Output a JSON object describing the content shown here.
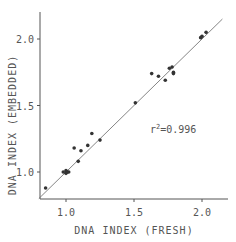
{
  "chart_data": {
    "type": "scatter",
    "title": "",
    "xlabel": "DNA INDEX   (FRESH)",
    "ylabel": "DNA INDEX   (EMBEDDED)",
    "xlim": [
      0.8,
      2.2
    ],
    "ylim": [
      0.8,
      2.2
    ],
    "x_ticks": [
      1.0,
      1.5,
      2.0
    ],
    "x_tick_labels": [
      "1.0",
      "1.5",
      "2.0"
    ],
    "y_ticks": [
      1.0,
      1.5,
      2.0
    ],
    "y_tick_labels": [
      "1.0",
      "1.5",
      "2.0"
    ],
    "grid": false,
    "annotation": "r²=0.996",
    "annotation_parts": {
      "base": "r",
      "sup": "2",
      "rest": "=0.996"
    },
    "regression_line": {
      "x": [
        0.8,
        2.15
      ],
      "y": [
        0.8,
        2.15
      ]
    },
    "points": [
      {
        "x": 0.85,
        "y": 0.88
      },
      {
        "x": 0.98,
        "y": 1.0
      },
      {
        "x": 1.0,
        "y": 1.01
      },
      {
        "x": 1.0,
        "y": 0.99
      },
      {
        "x": 1.01,
        "y": 1.0
      },
      {
        "x": 1.02,
        "y": 1.0
      },
      {
        "x": 1.06,
        "y": 1.18
      },
      {
        "x": 1.09,
        "y": 1.08
      },
      {
        "x": 1.11,
        "y": 1.16
      },
      {
        "x": 1.16,
        "y": 1.2
      },
      {
        "x": 1.19,
        "y": 1.29
      },
      {
        "x": 1.25,
        "y": 1.24
      },
      {
        "x": 1.51,
        "y": 1.52
      },
      {
        "x": 1.63,
        "y": 1.74
      },
      {
        "x": 1.68,
        "y": 1.72
      },
      {
        "x": 1.73,
        "y": 1.69
      },
      {
        "x": 1.76,
        "y": 1.78
      },
      {
        "x": 1.78,
        "y": 1.79
      },
      {
        "x": 1.79,
        "y": 1.75
      },
      {
        "x": 1.79,
        "y": 1.74
      },
      {
        "x": 1.99,
        "y": 2.01
      },
      {
        "x": 2.0,
        "y": 2.02
      },
      {
        "x": 2.03,
        "y": 2.05
      }
    ]
  }
}
